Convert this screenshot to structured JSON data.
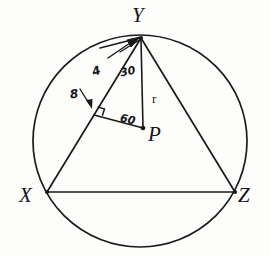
{
  "figure": {
    "kind": "geometry-diagram",
    "stroke_color": "#1a1a1a",
    "background_color": "#fdfdfc",
    "canvas": {
      "width": 270,
      "height": 255
    }
  },
  "circle": {
    "center_x": 140,
    "center_y": 141,
    "radius": 107,
    "label": "circle"
  },
  "points": {
    "X": {
      "label": "X",
      "x": 47,
      "y": 192,
      "label_x": 19,
      "label_y": 185
    },
    "Y": {
      "label": "Y",
      "x": 141,
      "y": 38,
      "label_x": 132,
      "label_y": 5
    },
    "Z": {
      "label": "Z",
      "x": 235,
      "y": 192,
      "label_x": 238,
      "label_y": 185
    },
    "P": {
      "label": "P",
      "x": 143,
      "y": 128,
      "label_x": 148,
      "label_y": 124
    },
    "F": {
      "label": "",
      "x": 94,
      "y": 115
    }
  },
  "segments": [
    {
      "name": "chord-XY",
      "from": "X",
      "to": "Y"
    },
    {
      "name": "chord-YZ",
      "from": "Y",
      "to": "Z"
    },
    {
      "name": "chord-XZ",
      "from": "X",
      "to": "Z"
    },
    {
      "name": "radius-PY",
      "from": "P",
      "to": "Y"
    },
    {
      "name": "perpendicular-PF",
      "from": "P",
      "to": "F"
    }
  ],
  "annotations": {
    "half_chord": {
      "text": "4",
      "x": 92,
      "y": 65,
      "name": "half-chord-length-label"
    },
    "angle_at_Y": {
      "text": "30",
      "x": 120,
      "y": 66,
      "name": "angle-30-label"
    },
    "eight": {
      "text": "8",
      "x": 70,
      "y": 88,
      "name": "chord-length-8-label"
    },
    "angle_at_P": {
      "text": "60",
      "x": 120,
      "y": 114,
      "name": "angle-60-label"
    },
    "radius": {
      "text": "r",
      "x": 152,
      "y": 92,
      "name": "radius-label"
    }
  },
  "marks": {
    "right_angle": {
      "name": "right-angle-mark",
      "at": "F"
    },
    "arrow_to_Y": {
      "name": "pointer-arrow-to-Y"
    },
    "arrow_to_foot": {
      "name": "pointer-arrow-to-foot"
    }
  }
}
